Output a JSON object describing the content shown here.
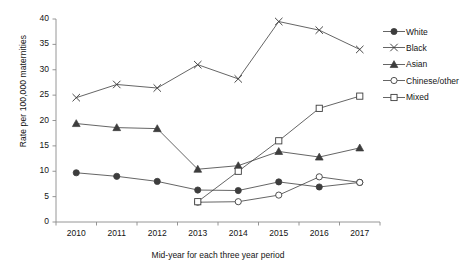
{
  "chart_data": {
    "type": "line",
    "title": "",
    "xlabel": "Mid-year for each three year period",
    "ylabel": "Rate per 100,000 maternities",
    "categories": [
      "2010",
      "2011",
      "2012",
      "2013",
      "2014",
      "2015",
      "2016",
      "2017"
    ],
    "x": [
      2010,
      2011,
      2012,
      2013,
      2014,
      2015,
      2016,
      2017
    ],
    "xlim": [
      2009.5,
      2017.5
    ],
    "ylim": [
      0,
      40
    ],
    "yticks": [
      0,
      5,
      10,
      15,
      20,
      25,
      30,
      35,
      40
    ],
    "grid": false,
    "legend_position": "right",
    "series": [
      {
        "name": "White",
        "marker": "filled-circle",
        "color": "#3d3d3d",
        "values": [
          9.7,
          9.0,
          8.0,
          6.3,
          6.2,
          7.9,
          6.9,
          7.8
        ]
      },
      {
        "name": "Black",
        "marker": "cross",
        "color": "#3d3d3d",
        "values": [
          24.5,
          27.1,
          26.4,
          31.0,
          28.2,
          39.5,
          37.8,
          34.0
        ]
      },
      {
        "name": "Asian",
        "marker": "filled-triangle",
        "color": "#3d3d3d",
        "values": [
          19.4,
          18.6,
          18.4,
          10.4,
          11.1,
          13.9,
          12.8,
          14.6
        ]
      },
      {
        "name": "Chinese/other",
        "marker": "open-circle",
        "color": "#3d3d3d",
        "values": [
          null,
          null,
          null,
          3.9,
          4.0,
          5.3,
          8.9,
          7.8
        ]
      },
      {
        "name": "Mixed",
        "marker": "open-square",
        "color": "#3d3d3d",
        "values": [
          null,
          null,
          null,
          4.0,
          10.0,
          16.0,
          22.4,
          24.8
        ]
      }
    ]
  },
  "legend": {
    "items": [
      {
        "label": "White",
        "marker": "filled-circle"
      },
      {
        "label": "Black",
        "marker": "cross"
      },
      {
        "label": "Asian",
        "marker": "filled-triangle"
      },
      {
        "label": "Chinese/other",
        "marker": "open-circle"
      },
      {
        "label": "Mixed",
        "marker": "open-square"
      }
    ]
  }
}
